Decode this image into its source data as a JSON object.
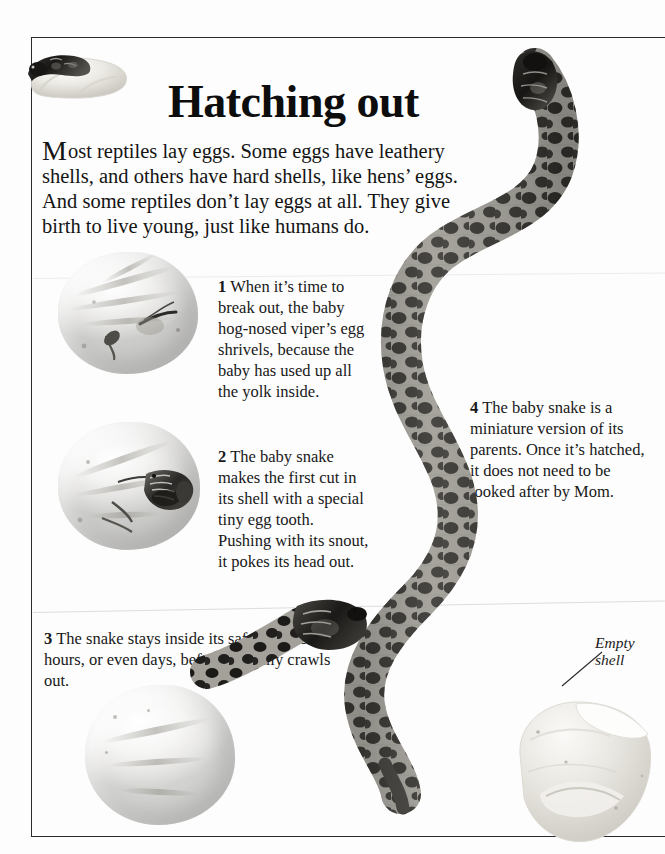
{
  "page": {
    "headline": "Hatching out",
    "intro_dropcap": "M",
    "intro_rest": "ost reptiles lay eggs. Some eggs have leathery shells, and others have hard shells, like hens’ eggs. And some reptiles don’t lay eggs at all. They give birth to live young, just like humans do.",
    "intro_full": "Most reptiles lay eggs. Some eggs have leathery shells, and others have hard shells, like hens’ eggs. And some reptiles don’t lay eggs at all. They give birth to live young, just like humans do."
  },
  "captions": [
    {
      "number": "1",
      "text": "When it’s time to break out, the  baby hog-nosed viper’s egg shrivels, because the baby has used up all the yolk inside."
    },
    {
      "number": "2",
      "text": "The baby snake makes the first cut in its shell with a special tiny egg tooth. Pushing with its snout, it pokes its head out."
    },
    {
      "number": "3",
      "text": "The snake stays inside its safe shell for hours, or even days, before it finally crawls out."
    },
    {
      "number": "4",
      "text": "The baby snake is a miniature version of its parents. Once it’s hatched, it does not need to be looked after by Mom."
    }
  ],
  "labels": {
    "empty_shell": "Empty\nshell"
  },
  "figures": {
    "inset_snake_in_shell": "snake-curled-in-hatched-shell-photo",
    "egg_shriveled": "shriveled-egg-photo",
    "egg_with_head": "egg-with-snake-head-emerging-photo",
    "egg_crawling_out": "egg-with-snake-crawling-out-photo",
    "empty_shell": "empty-collapsed-shell-photo",
    "baby_snake": "full-length-baby-hog-nosed-viper-photo"
  },
  "colors": {
    "ink": "#141414",
    "rule": "#2a2a2a",
    "paper": "#fdfdfd",
    "shell_light": "#f4f3f0",
    "shell_shadow": "#cfcdc5",
    "snake_dark": "#1d1c1a",
    "snake_light": "#b9b7b0"
  }
}
